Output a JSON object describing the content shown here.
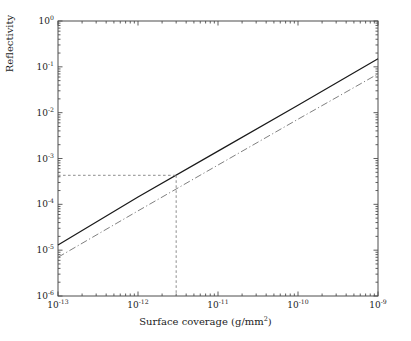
{
  "chart_data": {
    "type": "line",
    "title": "",
    "xlabel": "Surface coverage (g/mm2)",
    "xlabel_base": "Surface coverage (g/mm",
    "xlabel_sup": "2",
    "xlabel_tail": ")",
    "ylabel": "Reflectivity",
    "xscale": "log",
    "yscale": "log",
    "xlim": [
      1e-13,
      1e-09
    ],
    "ylim": [
      1e-06,
      1.0
    ],
    "grid": false,
    "legend": null,
    "background_color": "#ffffff",
    "axis_color": "#4d4d4d",
    "xticks": [
      {
        "value": 1e-13,
        "mantissa": "10",
        "exponent": "-13"
      },
      {
        "value": 1e-12,
        "mantissa": "10",
        "exponent": "-12"
      },
      {
        "value": 1e-11,
        "mantissa": "10",
        "exponent": "-11"
      },
      {
        "value": 1e-10,
        "mantissa": "10",
        "exponent": "-10"
      },
      {
        "value": 1e-09,
        "mantissa": "10",
        "exponent": "-9"
      }
    ],
    "yticks": [
      {
        "value": 1.0,
        "mantissa": "10",
        "exponent": "0"
      },
      {
        "value": 0.1,
        "mantissa": "10",
        "exponent": "-1"
      },
      {
        "value": 0.01,
        "mantissa": "10",
        "exponent": "-2"
      },
      {
        "value": 0.001,
        "mantissa": "10",
        "exponent": "-3"
      },
      {
        "value": 0.0001,
        "mantissa": "10",
        "exponent": "-4"
      },
      {
        "value": 1e-05,
        "mantissa": "10",
        "exponent": "-5"
      },
      {
        "value": 1e-06,
        "mantissa": "10",
        "exponent": "-6"
      }
    ],
    "series": [
      {
        "name": "solid-curve",
        "style": "solid",
        "color": "#1a1a1a",
        "x": [
          1e-13,
          1e-12,
          1e-11,
          1e-10,
          1e-09
        ],
        "y": [
          1.3e-05,
          0.000145,
          0.00145,
          0.0145,
          0.15
        ]
      },
      {
        "name": "dash-dot-curve",
        "style": "dashdot",
        "color": "#808080",
        "x": [
          1e-13,
          1e-12,
          1e-11,
          1e-10,
          1e-09
        ],
        "y": [
          7e-06,
          7.2e-05,
          0.00072,
          0.0072,
          0.07
        ]
      }
    ],
    "annotations": [
      {
        "name": "guide-crosshair",
        "style": "dashed",
        "color": "#808080",
        "x": 3e-12,
        "y": 0.00043,
        "description": "dashed guide lines from axes to intersection on solid curve"
      }
    ]
  }
}
